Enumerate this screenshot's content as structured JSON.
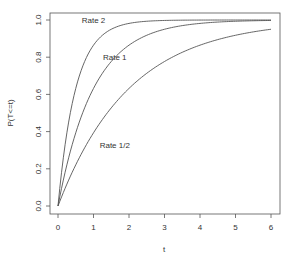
{
  "chart_data": {
    "type": "line",
    "title": "",
    "xlabel": "t",
    "ylabel": "P(T<=t)",
    "xlim": [
      0,
      6
    ],
    "ylim": [
      0,
      1
    ],
    "xticks": [
      0,
      1,
      2,
      3,
      4,
      5,
      6
    ],
    "yticks": [
      "0.0",
      "0.2",
      "0.4",
      "0.6",
      "0.8",
      "1.0"
    ],
    "grid": false,
    "legend": "none (inline annotations)",
    "x": [
      0,
      0.25,
      0.5,
      0.75,
      1,
      1.5,
      2,
      2.5,
      3,
      4,
      5,
      6
    ],
    "series": [
      {
        "name": "Rate 2",
        "rate": 2,
        "values": [
          0,
          0.39,
          0.63,
          0.78,
          0.86,
          0.95,
          0.98,
          0.99,
          1.0,
          1.0,
          1.0,
          1.0
        ]
      },
      {
        "name": "Rate 1",
        "rate": 1,
        "values": [
          0,
          0.22,
          0.39,
          0.53,
          0.63,
          0.78,
          0.86,
          0.92,
          0.95,
          0.98,
          0.99,
          1.0
        ]
      },
      {
        "name": "Rate 1/2",
        "rate": 0.5,
        "values": [
          0,
          0.12,
          0.22,
          0.31,
          0.39,
          0.53,
          0.63,
          0.71,
          0.78,
          0.86,
          0.92,
          0.95
        ]
      }
    ],
    "annotations": [
      {
        "text": "Rate 2",
        "x": 1.0,
        "y": 1.0
      },
      {
        "text": "Rate 1",
        "x": 1.6,
        "y": 0.8
      },
      {
        "text": "Rate 1/2",
        "x": 1.6,
        "y": 0.33
      }
    ]
  }
}
